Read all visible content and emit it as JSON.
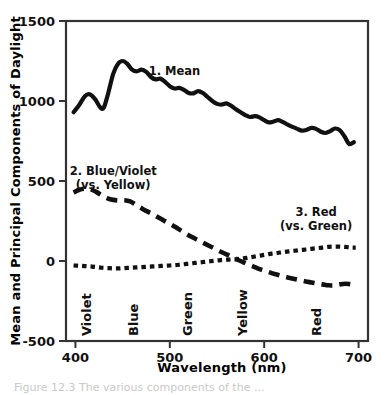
{
  "figure": {
    "background_color": "#ffffff",
    "ink_color": "#111111",
    "frame_color": "#333333"
  },
  "chart_data": {
    "type": "line",
    "title": "",
    "xlabel": "Wavelength (nm)",
    "ylabel": "Mean and Principal Components of Daylight",
    "xlim": [
      390,
      710
    ],
    "ylim": [
      -500,
      1500
    ],
    "xticks": [
      400,
      500,
      600,
      700
    ],
    "yticks": [
      -500,
      0,
      500,
      1000,
      1500
    ],
    "xtick_labels": [
      "400",
      "500",
      "600",
      "700"
    ],
    "ytick_labels": [
      "-500",
      "0",
      "500",
      "1000",
      "1500"
    ],
    "grid": false,
    "legend_position": "inline-annotations",
    "band_labels": [
      {
        "text": "Violet",
        "x": 416
      },
      {
        "text": "Blue",
        "x": 466
      },
      {
        "text": "Green",
        "x": 524
      },
      {
        "text": "Yellow",
        "x": 582
      },
      {
        "text": "Red",
        "x": 660
      }
    ],
    "annotations": [
      {
        "id": "mean",
        "lines": [
          "1. Mean"
        ],
        "x": 505,
        "y": 1160
      },
      {
        "id": "blue-violet",
        "lines": [
          "2. Blue/Violet",
          "(vs. Yellow)"
        ],
        "x": 440,
        "y": 540
      },
      {
        "id": "red-green",
        "lines": [
          "3. Red",
          "(vs. Green)"
        ],
        "x": 655,
        "y": 280
      }
    ],
    "series": [
      {
        "name": "1. Mean",
        "style": "solid",
        "x": [
          398,
          404,
          410,
          415,
          421,
          426,
          430,
          435,
          440,
          445,
          450,
          455,
          460,
          465,
          470,
          475,
          480,
          485,
          490,
          495,
          500,
          505,
          510,
          515,
          520,
          525,
          530,
          535,
          540,
          545,
          550,
          555,
          560,
          565,
          570,
          575,
          580,
          585,
          590,
          595,
          600,
          605,
          610,
          615,
          620,
          625,
          630,
          635,
          640,
          645,
          650,
          655,
          660,
          665,
          670,
          675,
          680,
          685,
          690,
          695
        ],
        "values": [
          930,
          975,
          1030,
          1042,
          1010,
          962,
          958,
          1055,
          1170,
          1232,
          1250,
          1232,
          1196,
          1185,
          1196,
          1182,
          1150,
          1135,
          1140,
          1120,
          1092,
          1078,
          1082,
          1070,
          1050,
          1048,
          1062,
          1050,
          1025,
          1000,
          982,
          978,
          985,
          970,
          948,
          930,
          912,
          900,
          905,
          898,
          880,
          866,
          872,
          880,
          868,
          852,
          838,
          826,
          815,
          820,
          832,
          826,
          808,
          800,
          812,
          828,
          818,
          780,
          732,
          742
        ]
      },
      {
        "name": "2. Blue/Violet (vs. Yellow)",
        "style": "dashed-long",
        "x": [
          398,
          404,
          410,
          416,
          422,
          428,
          434,
          440,
          446,
          452,
          458,
          464,
          470,
          476,
          482,
          488,
          494,
          500,
          506,
          512,
          518,
          524,
          530,
          536,
          542,
          548,
          554,
          560,
          566,
          572,
          578,
          584,
          590,
          596,
          602,
          608,
          614,
          620,
          626,
          632,
          638,
          644,
          650,
          656,
          662,
          668,
          674,
          680,
          686,
          692,
          697
        ],
        "values": [
          428,
          445,
          452,
          448,
          432,
          410,
          392,
          382,
          378,
          380,
          372,
          352,
          330,
          310,
          292,
          272,
          252,
          232,
          212,
          190,
          168,
          148,
          130,
          112,
          94,
          76,
          58,
          42,
          26,
          8,
          -8,
          -24,
          -38,
          -52,
          -64,
          -76,
          -86,
          -96,
          -104,
          -112,
          -120,
          -128,
          -134,
          -140,
          -146,
          -152,
          -152,
          -146,
          -142,
          -146,
          -148
        ]
      },
      {
        "name": "3. Red (vs. Green)",
        "style": "dashed-short",
        "x": [
          398,
          404,
          410,
          416,
          422,
          428,
          434,
          440,
          446,
          452,
          458,
          464,
          470,
          476,
          482,
          488,
          494,
          500,
          506,
          512,
          518,
          524,
          530,
          536,
          542,
          548,
          554,
          560,
          566,
          572,
          578,
          584,
          590,
          596,
          602,
          608,
          614,
          620,
          626,
          632,
          638,
          644,
          650,
          656,
          662,
          668,
          674,
          680,
          686,
          692,
          697
        ],
        "values": [
          -28,
          -30,
          -32,
          -34,
          -38,
          -42,
          -44,
          -46,
          -46,
          -44,
          -42,
          -40,
          -38,
          -36,
          -34,
          -32,
          -30,
          -28,
          -26,
          -22,
          -18,
          -14,
          -10,
          -6,
          -2,
          2,
          6,
          8,
          10,
          12,
          16,
          22,
          28,
          34,
          40,
          46,
          50,
          56,
          60,
          64,
          68,
          72,
          76,
          80,
          84,
          88,
          90,
          90,
          88,
          84,
          84
        ]
      }
    ]
  },
  "caption": {
    "clipped_text": "Figure 12.3  The various components of the ..."
  }
}
